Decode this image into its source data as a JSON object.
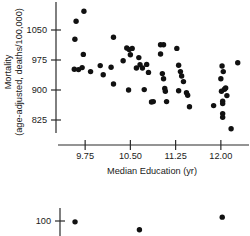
{
  "figure": {
    "name": "mortality-vs-education-scatterplot",
    "background": "#ffffff",
    "point_color": "#111111"
  },
  "chart_data": {
    "type": "scatter",
    "title": "",
    "subtitle": "",
    "xlabel": "Median Education (yr)",
    "ylabel": "Mortality (age-adjusted, deaths/100,000)",
    "ylabel_line1": "Mortality",
    "ylabel_line2": "(age-adjusted, deaths/100,000)",
    "xticks": [
      "9.75",
      "10.50",
      "11.25",
      "12.00"
    ],
    "xtick_values": [
      9.75,
      10.5,
      11.25,
      12.0
    ],
    "yticks": [
      "1050",
      "975",
      "900",
      "825"
    ],
    "ytick_values": [
      1050,
      975,
      900,
      825
    ],
    "xlim": [
      9.3,
      12.45
    ],
    "ylim": [
      780,
      1115
    ],
    "grid": false,
    "legend": null,
    "marker": "filled-circle",
    "points": [
      [
        9.73,
        1097
      ],
      [
        9.6,
        1072
      ],
      [
        9.58,
        1027
      ],
      [
        9.72,
        989
      ],
      [
        9.57,
        952
      ],
      [
        9.64,
        951
      ],
      [
        9.7,
        956
      ],
      [
        9.84,
        946
      ],
      [
        10.0,
        961
      ],
      [
        10.05,
        938
      ],
      [
        10.22,
        1032
      ],
      [
        10.18,
        957
      ],
      [
        10.22,
        915
      ],
      [
        10.38,
        973
      ],
      [
        10.44,
        1005
      ],
      [
        10.48,
        1001
      ],
      [
        10.5,
        988
      ],
      [
        10.53,
        1004
      ],
      [
        10.47,
        900
      ],
      [
        10.6,
        955
      ],
      [
        10.64,
        981
      ],
      [
        10.66,
        963
      ],
      [
        10.7,
        955
      ],
      [
        10.73,
        901
      ],
      [
        10.77,
        964
      ],
      [
        10.8,
        944
      ],
      [
        10.85,
        870
      ],
      [
        10.88,
        871
      ],
      [
        11.0,
        1013
      ],
      [
        11.05,
        1013
      ],
      [
        11.0,
        990
      ],
      [
        11.03,
        941
      ],
      [
        11.05,
        928
      ],
      [
        11.07,
        904
      ],
      [
        11.08,
        897
      ],
      [
        11.1,
        871
      ],
      [
        11.27,
        1004
      ],
      [
        11.3,
        962
      ],
      [
        11.33,
        946
      ],
      [
        11.35,
        935
      ],
      [
        11.38,
        921
      ],
      [
        11.3,
        898
      ],
      [
        11.43,
        893
      ],
      [
        11.45,
        887
      ],
      [
        11.48,
        858
      ],
      [
        11.88,
        861
      ],
      [
        12.02,
        960
      ],
      [
        12.0,
        928
      ],
      [
        12.04,
        946
      ],
      [
        12.01,
        897
      ],
      [
        12.06,
        902
      ],
      [
        12.08,
        905
      ],
      [
        12.03,
        872
      ],
      [
        12.03,
        866
      ],
      [
        12.03,
        841
      ],
      [
        12.03,
        832
      ],
      [
        12.1,
        886
      ],
      [
        12.17,
        803
      ],
      [
        12.28,
        968
      ]
    ]
  },
  "secondary_chart": {
    "type": "scatter",
    "note": "partially visible chart cropped at bottom edge",
    "yticks": [
      "100"
    ],
    "points": [
      [
        0.06,
        97
      ],
      [
        0.41,
        92
      ],
      [
        0.86,
        100
      ]
    ]
  }
}
